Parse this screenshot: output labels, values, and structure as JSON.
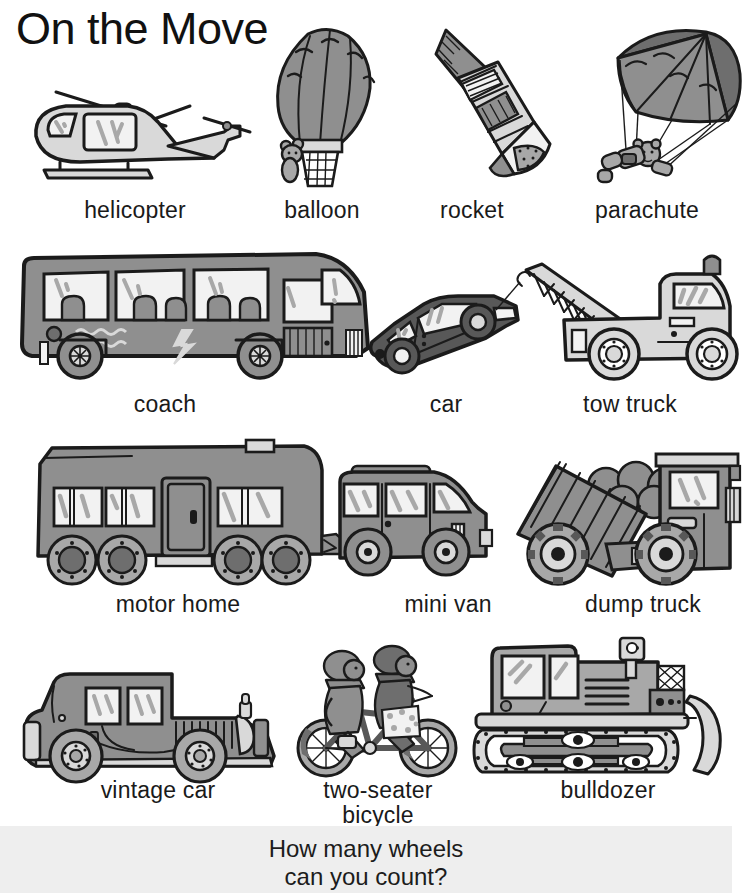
{
  "page": {
    "title": "On the Move",
    "background_color": "#ffffff",
    "ink_color": "#1b1b1b",
    "band_color": "#eeeeee"
  },
  "palette": {
    "light_gray": "#d9d9d9",
    "mid_gray": "#a8a8a8",
    "gray": "#8f8f8f",
    "dark_gray": "#6e6e6e",
    "darker_gray": "#585858",
    "near_white": "#f2f2f2",
    "white": "#ffffff"
  },
  "rows": [
    {
      "row_index": 1,
      "items": [
        {
          "id": "helicopter",
          "label": "helicopter"
        },
        {
          "id": "balloon",
          "label": "balloon"
        },
        {
          "id": "rocket",
          "label": "rocket"
        },
        {
          "id": "parachute",
          "label": "parachute"
        }
      ]
    },
    {
      "row_index": 2,
      "items": [
        {
          "id": "coach",
          "label": "coach"
        },
        {
          "id": "car",
          "label": "car"
        },
        {
          "id": "tow-truck",
          "label": "tow truck"
        }
      ]
    },
    {
      "row_index": 3,
      "items": [
        {
          "id": "motor-home",
          "label": "motor home"
        },
        {
          "id": "mini-van",
          "label": "mini van"
        },
        {
          "id": "dump-truck",
          "label": "dump truck"
        }
      ]
    },
    {
      "row_index": 4,
      "items": [
        {
          "id": "vintage-car",
          "label": "vintage car"
        },
        {
          "id": "two-seater-bicycle",
          "label": "two-seater\nbicycle"
        },
        {
          "id": "bulldozer",
          "label": "bulldozer"
        }
      ]
    }
  ],
  "question": {
    "line1": "How many wheels",
    "line2": "can you count?"
  }
}
